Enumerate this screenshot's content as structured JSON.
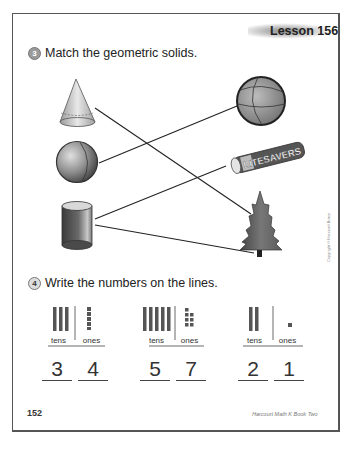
{
  "header": {
    "lesson": "Lesson 156"
  },
  "problem3": {
    "number": "3",
    "instruction": "Match the geometric solids.",
    "left_items": [
      {
        "name": "cone"
      },
      {
        "name": "sphere"
      },
      {
        "name": "cylinder"
      }
    ],
    "right_items": [
      {
        "name": "ball"
      },
      {
        "name": "candy-roll",
        "label": "LITESAVERS"
      },
      {
        "name": "pine-tree"
      }
    ],
    "matches": [
      {
        "from": "cone",
        "to": "pine-tree"
      },
      {
        "from": "sphere",
        "to": "ball"
      },
      {
        "from": "cylinder",
        "to": "candy-roll"
      },
      {
        "from": "cylinder",
        "to": "pine-tree"
      }
    ]
  },
  "problem4": {
    "number": "4",
    "instruction": "Write the numbers on the lines.",
    "columns": [
      "tens",
      "ones"
    ],
    "sets": [
      {
        "tens": "3",
        "ones": "4"
      },
      {
        "tens": "5",
        "ones": "7"
      },
      {
        "tens": "2",
        "ones": "1"
      }
    ]
  },
  "footer": {
    "page_number": "152",
    "credit": "Harcourt Math K Book Two"
  },
  "side_note": "Copyright © Harcourt Brace"
}
